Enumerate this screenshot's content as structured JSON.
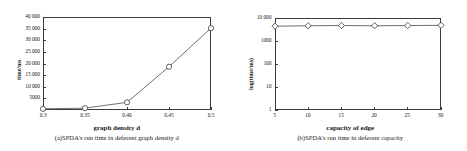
{
  "figure": {
    "panels": [
      {
        "id": "a",
        "caption": "(a)SPDA's run time in deferent graph density d",
        "xlabel": "graph density d",
        "ylabel": "time/ms"
      },
      {
        "id": "b",
        "caption": "(b)SPDA's run time in deferent capacity",
        "xlabel": "capacity of edge",
        "ylabel": "log(time/ms)"
      }
    ]
  },
  "chart_data": [
    {
      "type": "line",
      "title": "(a)SPDA's run time in deferent graph density d",
      "xlabel": "graph density d",
      "ylabel": "time/ms",
      "x": [
        0.3,
        0.35,
        0.4,
        0.45,
        0.5
      ],
      "values": [
        500,
        800,
        3300,
        18600,
        35200
      ],
      "xtick_labels": [
        "0.3",
        "0.35",
        "0.40",
        "0.45",
        "0.5"
      ],
      "ytick_labels": [
        "5000",
        "10 000",
        "15 000",
        "20 000",
        "25 000",
        "30 000",
        "35 000",
        "40 000"
      ],
      "ytick_values": [
        5000,
        10000,
        15000,
        20000,
        25000,
        30000,
        35000,
        40000
      ],
      "xlim": [
        0.3,
        0.5
      ],
      "ylim": [
        0,
        40000
      ],
      "yscale": "linear",
      "marker": "circle",
      "grid": false,
      "legend": false
    },
    {
      "type": "line",
      "title": "(b)SPDA's run time in deferent capacity",
      "xlabel": "capacity of edge",
      "ylabel": "log(time/ms)",
      "x": [
        5,
        10,
        15,
        20,
        25,
        30
      ],
      "values": [
        4400,
        4600,
        4700,
        4600,
        4700,
        4800
      ],
      "xtick_labels": [
        "5",
        "10",
        "15",
        "20",
        "25",
        "30"
      ],
      "ytick_labels": [
        "1",
        "10",
        "100",
        "1000",
        "10 000"
      ],
      "ytick_values": [
        1,
        10,
        100,
        1000,
        10000
      ],
      "xlim": [
        5,
        30
      ],
      "ylim": [
        1,
        10000
      ],
      "yscale": "log",
      "marker": "diamond",
      "grid": false,
      "legend": false
    }
  ],
  "style": {
    "axis_color": "#3a3a3a",
    "line_color": "#4a4a4a",
    "marker_fill": "#ffffff"
  }
}
